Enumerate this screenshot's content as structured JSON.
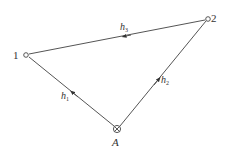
{
  "diagram": {
    "type": "directed-graph",
    "nodes": [
      {
        "id": "1",
        "label": "1",
        "x": 26,
        "y": 55,
        "shape": "small-circle"
      },
      {
        "id": "2",
        "label": "2",
        "x": 208,
        "y": 19,
        "shape": "small-circle"
      },
      {
        "id": "A",
        "label": "A",
        "x": 117,
        "y": 129,
        "shape": "circle-cross"
      }
    ],
    "edges": [
      {
        "from": "A",
        "to": "1",
        "label_main": "h",
        "label_sub": "1"
      },
      {
        "from": "A",
        "to": "2",
        "label_main": "h",
        "label_sub": "2"
      },
      {
        "from": "2",
        "to": "1",
        "label_main": "h",
        "label_sub": "3"
      }
    ]
  },
  "labels": {
    "node1": "1",
    "node2": "2",
    "nodeA": "A",
    "h1_main": "h",
    "h1_sub": "1",
    "h2_main": "h",
    "h2_sub": "2",
    "h3_main": "h",
    "h3_sub": "3"
  },
  "colors": {
    "line": "#555555",
    "text": "#333333",
    "background": "#ffffff"
  }
}
